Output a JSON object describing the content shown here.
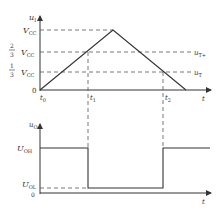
{
  "upper_plot": {
    "y_axis_label": "u",
    "y_axis_label_sub": "I",
    "x_axis_label": "t",
    "origin_label": "0",
    "y_levels": [
      {
        "name": "vcc",
        "coef": "",
        "label": "V",
        "sub": "CC",
        "right_label": "",
        "right_sub": ""
      },
      {
        "name": "two-thirds-vcc",
        "coef_num": "2",
        "coef_den": "3",
        "label": "V",
        "sub": "CC",
        "right_label": "u",
        "right_sub": "T+"
      },
      {
        "name": "one-third-vcc",
        "coef_num": "1",
        "coef_den": "3",
        "label": "V",
        "sub": "CC",
        "right_label": "u",
        "right_sub": "T"
      }
    ],
    "time_marks": [
      {
        "label": "t",
        "sub": "0"
      },
      {
        "label": "t",
        "sub": "1"
      },
      {
        "label": "t",
        "sub": "2"
      }
    ],
    "waveform": "triangle"
  },
  "lower_plot": {
    "y_axis_label": "u",
    "y_axis_label_sub": "O",
    "x_axis_label": "t",
    "origin_label": "0",
    "levels": [
      {
        "name": "uoh",
        "label": "U",
        "sub": "OH"
      },
      {
        "name": "uol",
        "label": "U",
        "sub": "OL"
      }
    ],
    "waveform": "square"
  },
  "colors": {
    "line": "#333333",
    "dash": "#555555",
    "background": "#ffffff"
  }
}
